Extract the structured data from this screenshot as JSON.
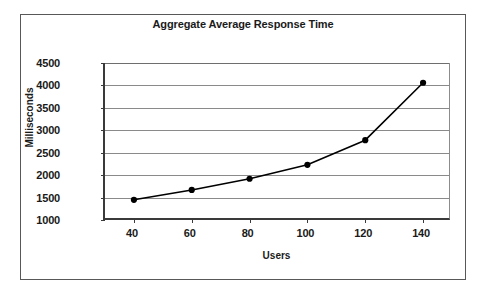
{
  "chart_data": {
    "type": "line",
    "title": "Aggregate Average Response Time",
    "xlabel": "Users",
    "ylabel": "Milliseconds",
    "x": [
      40,
      60,
      80,
      100,
      120,
      140
    ],
    "values": [
      1450,
      1670,
      1920,
      2230,
      2780,
      4060
    ],
    "series": [
      {
        "name": "Aggregate Average Response Time",
        "values": [
          1450,
          1670,
          1920,
          2230,
          2780,
          4060
        ]
      }
    ],
    "xtick_labels": [
      "40",
      "60",
      "80",
      "100",
      "120",
      "140"
    ],
    "ytick_labels": [
      "1000",
      "1500",
      "2000",
      "2500",
      "3000",
      "3500",
      "4000",
      "4500"
    ],
    "yticks": [
      1000,
      1500,
      2000,
      2500,
      3000,
      3500,
      4000,
      4500
    ],
    "xlim": [
      30,
      150
    ],
    "ylim": [
      1000,
      4500
    ],
    "grid": "horizontal",
    "legend": "none",
    "marker": "filled-circle",
    "line_color": "#000000",
    "marker_color": "#000000",
    "gridline_color": "#8a8a8a",
    "axis_color": "#3a3a3a",
    "plot_background": "#ffffff",
    "frame_color": "#585858"
  }
}
